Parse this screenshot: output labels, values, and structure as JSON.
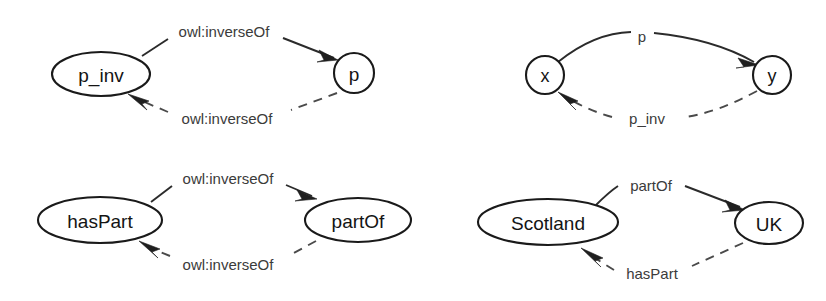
{
  "figure": {
    "background_color": "#ffffff",
    "node_stroke_color": "#1a1a1a",
    "solid_edge_color": "#2b2b2b",
    "dashed_edge_color": "#4a4a4a",
    "label_color": "#3b3b3b",
    "width": 826,
    "height": 301
  },
  "panels": [
    {
      "id": "panel-top-left",
      "name": "schema-generic",
      "nodes": [
        {
          "id": "p_inv",
          "label": "p_inv",
          "shape": "ellipse",
          "cx": 101,
          "cy": 74,
          "rx": 49,
          "ry": 22
        },
        {
          "id": "p",
          "label": "p",
          "shape": "circle",
          "cx": 354,
          "cy": 73,
          "rx": 20,
          "ry": 20
        }
      ],
      "edges": [
        {
          "id": "e-top",
          "from": "p_inv",
          "to": "p",
          "style": "solid",
          "label": "owl:inverseOf",
          "label_x": 224,
          "label_y": 31
        },
        {
          "id": "e-bottom",
          "from": "p",
          "to": "p_inv",
          "style": "dashed",
          "label": "owl:inverseOf",
          "label_x": 227,
          "label_y": 118
        }
      ]
    },
    {
      "id": "panel-top-right",
      "name": "instance-generic",
      "nodes": [
        {
          "id": "x",
          "label": "x",
          "shape": "circle",
          "cx": 545,
          "cy": 75,
          "rx": 19,
          "ry": 19
        },
        {
          "id": "y",
          "label": "y",
          "shape": "circle",
          "cx": 772,
          "cy": 75,
          "rx": 19,
          "ry": 19
        }
      ],
      "edges": [
        {
          "id": "e-p",
          "from": "x",
          "to": "y",
          "style": "solid",
          "label": "p",
          "label_x": 642,
          "label_y": 36
        },
        {
          "id": "e-p-inv",
          "from": "y",
          "to": "x",
          "style": "dashed",
          "label": "p_inv",
          "label_x": 647,
          "label_y": 118
        }
      ]
    },
    {
      "id": "panel-bottom-left",
      "name": "schema-parts",
      "nodes": [
        {
          "id": "hasPart",
          "label": "hasPart",
          "shape": "ellipse",
          "cx": 100,
          "cy": 220,
          "rx": 62,
          "ry": 23
        },
        {
          "id": "partOf",
          "label": "partOf",
          "shape": "ellipse",
          "cx": 358,
          "cy": 220,
          "rx": 53,
          "ry": 22
        }
      ],
      "edges": [
        {
          "id": "e-top2",
          "from": "hasPart",
          "to": "partOf",
          "style": "solid",
          "label": "owl:inverseOf",
          "label_x": 228,
          "label_y": 178
        },
        {
          "id": "e-bottom2",
          "from": "partOf",
          "to": "hasPart",
          "style": "dashed",
          "label": "owl:inverseOf",
          "label_x": 228,
          "label_y": 264
        }
      ]
    },
    {
      "id": "panel-bottom-right",
      "name": "instance-parts",
      "nodes": [
        {
          "id": "Scotland",
          "label": "Scotland",
          "shape": "ellipse",
          "cx": 548,
          "cy": 222,
          "rx": 70,
          "ry": 23
        },
        {
          "id": "UK",
          "label": "UK",
          "shape": "ellipse",
          "cx": 769,
          "cy": 223,
          "rx": 34,
          "ry": 21
        }
      ],
      "edges": [
        {
          "id": "e-partOf",
          "from": "Scotland",
          "to": "UK",
          "style": "solid",
          "label": "partOf",
          "label_x": 651,
          "label_y": 185
        },
        {
          "id": "e-hasPart",
          "from": "UK",
          "to": "Scotland",
          "style": "dashed",
          "label": "hasPart",
          "label_x": 652,
          "label_y": 273
        }
      ]
    }
  ],
  "labels": {
    "p_inv": "p_inv",
    "p": "p",
    "x": "x",
    "y": "y",
    "hasPart": "hasPart",
    "partOf": "partOf",
    "Scotland": "Scotland",
    "UK": "UK",
    "owl_inverse_of": "owl:inverseOf"
  }
}
